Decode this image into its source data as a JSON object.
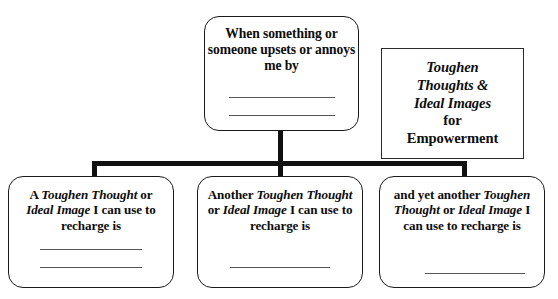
{
  "worksheet": {
    "title_box": {
      "name": "toughen-thoughts-title",
      "line1": "Toughen",
      "line2": "Thoughts &",
      "line3": "Ideal Images",
      "line4": "for",
      "line5": "Empowerment"
    },
    "prompt_box": {
      "text": "When something or someone upsets or annoys me by",
      "blank_lines": 2
    },
    "response_boxes": [
      {
        "id": "response-1",
        "segments": [
          {
            "text": "A ",
            "style": "bold"
          },
          {
            "text": "Toughen Thought",
            "style": "bold-italic"
          },
          {
            "text": " or ",
            "style": "bold"
          },
          {
            "text": "Ideal Image",
            "style": "bold-italic"
          },
          {
            "text": " I can use to recharge is",
            "style": "bold"
          }
        ],
        "plain_text": "A Toughen Thought or Ideal Image I can use to recharge is",
        "blank_lines": 2
      },
      {
        "id": "response-2",
        "segments": [
          {
            "text": "Another ",
            "style": "bold"
          },
          {
            "text": "Toughen Thought",
            "style": "bold-italic"
          },
          {
            "text": " or ",
            "style": "bold"
          },
          {
            "text": "Ideal Image",
            "style": "bold-italic"
          },
          {
            "text": " I can use to recharge is",
            "style": "bold"
          }
        ],
        "plain_text": "Another Toughen Thought or Ideal Image I can use to recharge is",
        "blank_lines": 1
      },
      {
        "id": "response-3",
        "segments": [
          {
            "text": "and yet another ",
            "style": "bold"
          },
          {
            "text": "Toughen Thought",
            "style": "bold-italic"
          },
          {
            "text": " or ",
            "style": "bold"
          },
          {
            "text": "Ideal Image",
            "style": "bold-italic"
          },
          {
            "text": " I can use to recharge is",
            "style": "bold"
          }
        ],
        "plain_text": "and yet another Toughen Thought or Ideal Image I can use to recharge is",
        "blank_lines": 1
      }
    ],
    "colors": {
      "background": "#ffffff",
      "box_border": "#1a1a1a",
      "connector": "#111111",
      "write_line": "#555555",
      "text": "#0d0d0d"
    }
  }
}
